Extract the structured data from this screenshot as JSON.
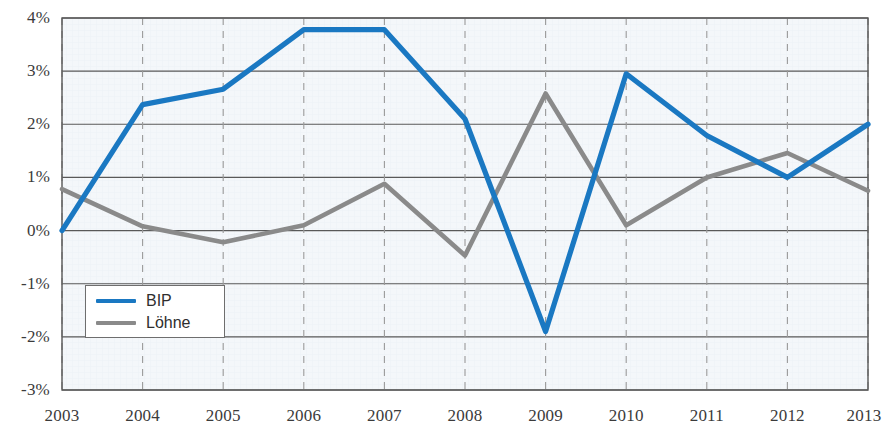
{
  "chart_data": {
    "type": "line",
    "title": "",
    "subtitle": "",
    "xlabel": "",
    "ylabel": "",
    "categories": [
      "2003",
      "2004",
      "2005",
      "2006",
      "2007",
      "2008",
      "2009",
      "2010",
      "2011",
      "2012",
      "2013"
    ],
    "x": [
      2003,
      2004,
      2005,
      2006,
      2007,
      2008,
      2009,
      2010,
      2011,
      2012,
      2013
    ],
    "series": [
      {
        "name": "BIP",
        "color": "#1a78c2",
        "values": [
          0.0,
          2.37,
          2.66,
          3.78,
          3.78,
          2.1,
          -1.9,
          2.95,
          1.79,
          1.0,
          2.0
        ]
      },
      {
        "name": "Löhne",
        "color": "#8a8a8a",
        "values": [
          0.78,
          0.08,
          -0.22,
          0.1,
          0.88,
          -0.47,
          2.58,
          0.1,
          1.0,
          1.46,
          0.75
        ]
      }
    ],
    "ylim": [
      -3,
      4
    ],
    "yticks": [
      4,
      3,
      2,
      1,
      0,
      -1,
      -2,
      -3
    ],
    "ytick_labels": [
      "4%",
      "3%",
      "2%",
      "1%",
      "0%",
      "-1%",
      "-2%",
      "-3%"
    ],
    "xlim": [
      2003,
      2013
    ],
    "grid": true,
    "grid_horizontal": "solid",
    "grid_vertical": "dashed",
    "legend_position": "inner-bottom-left",
    "unit": "%"
  },
  "legend": {
    "entries": [
      {
        "label": "BIP",
        "color": "#1a78c2"
      },
      {
        "label": "Löhne",
        "color": "#8a8a8a"
      }
    ]
  },
  "axes": {
    "y_tick_labels": [
      "4%",
      "3%",
      "2%",
      "1%",
      "0%",
      "-1%",
      "-2%",
      "-3%"
    ],
    "x_tick_labels": [
      "2003",
      "2004",
      "2005",
      "2006",
      "2007",
      "2008",
      "2009",
      "2010",
      "2011",
      "2012",
      "2013"
    ]
  },
  "colors": {
    "series_bip": "#1a78c2",
    "series_loehne": "#8a8a8a",
    "plot_background": "#f4f7fa",
    "grid_horizontal": "#595959",
    "grid_vertical": "#9a9a9a",
    "border": "#555555",
    "text": "#3b3b3b"
  }
}
